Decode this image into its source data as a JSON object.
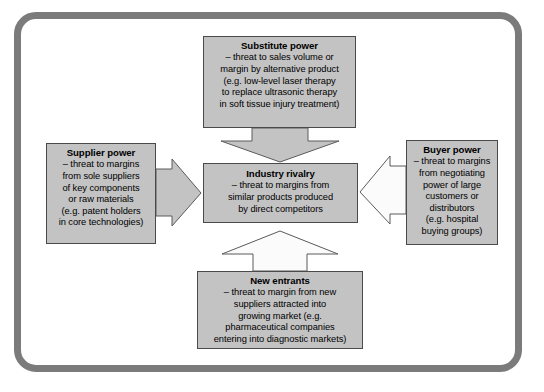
{
  "diagram": {
    "frame": {
      "border_color": "#7b7b7b",
      "background": "#ffffff"
    },
    "box_fill": "#c3c3c3",
    "box_border": "#4a4a4a",
    "arrow_fill_filled": "#c3c3c3",
    "arrow_fill_hollow": "#fbfbfb",
    "arrow_border": "#5a5a5a"
  },
  "forces": {
    "substitute": {
      "title": "Substitute power",
      "body": "– threat to sales volume or\nmargin by alternative product\n(e.g. low-level laser therapy\nto replace ultrasonic therapy\nin soft tissue injury treatment)"
    },
    "supplier": {
      "title": "Supplier power",
      "body": "– threat to margins\nfrom sole suppliers\nof key components\nor raw materials\n(e.g. patent holders\nin core technologies)"
    },
    "buyer": {
      "title": "Buyer power",
      "body": "– threat to margins\nfrom negotiating\npower of large\ncustomers or\ndistributors\n(e.g. hospital\nbuying groups)"
    },
    "rivalry": {
      "title": "Industry rivalry",
      "body": "– threat to margins from\nsimilar products produced\nby direct competitors"
    },
    "entrants": {
      "title": "New entrants",
      "body": "– threat to margin from new\nsuppliers attracted into\ngrowing market (e.g.\npharmaceutical companies\nentering into diagnostic markets)"
    }
  },
  "arrows": {
    "from_substitute": {
      "direction": "down",
      "style": "filled"
    },
    "from_supplier": {
      "direction": "right",
      "style": "filled"
    },
    "from_buyer": {
      "direction": "left",
      "style": "hollow"
    },
    "from_entrants": {
      "direction": "up",
      "style": "hollow"
    }
  }
}
